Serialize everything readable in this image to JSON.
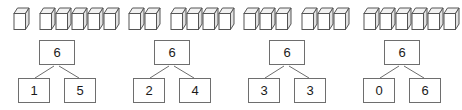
{
  "worksheet": {
    "title": "Number bonds of 6 with cube models",
    "total": 6,
    "colors": {
      "stroke": "#6e6e6e",
      "cube_stroke": "#555555",
      "cube_top_fill": "#f2f2f2",
      "cube_front_fill": "#ffffff",
      "cube_side_fill": "#e2e2e2",
      "text": "#1a1a1a",
      "background": "#ffffff"
    },
    "groups": [
      {
        "id": "group-1",
        "cube_runs": [
          1,
          5
        ],
        "bond": {
          "whole": "6",
          "part_left": "1",
          "part_right": "5"
        }
      },
      {
        "id": "group-2",
        "cube_runs": [
          2,
          4
        ],
        "bond": {
          "whole": "6",
          "part_left": "2",
          "part_right": "4"
        }
      },
      {
        "id": "group-3",
        "cube_runs": [
          3,
          3
        ],
        "bond": {
          "whole": "6",
          "part_left": "3",
          "part_right": "3"
        }
      },
      {
        "id": "group-4",
        "cube_runs": [
          6
        ],
        "bond": {
          "whole": "6",
          "part_left": "0",
          "part_right": "6"
        }
      }
    ]
  }
}
